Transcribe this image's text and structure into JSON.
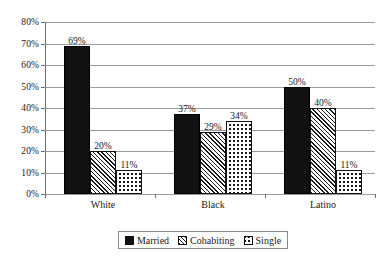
{
  "chart_data": {
    "type": "bar",
    "title": "",
    "subtitle": "",
    "xlabel": "",
    "ylabel": "",
    "categories": [
      "White",
      "Black",
      "Latino"
    ],
    "series": [
      {
        "name": "Married",
        "values": [
          69,
          20,
          11
        ]
      },
      {
        "name": "Cohabiting",
        "values": [
          37,
          29,
          34
        ]
      },
      {
        "name": "Single",
        "values": [
          50,
          40,
          11
        ]
      }
    ],
    "series_by_category": [
      {
        "category": "White",
        "Married": 69,
        "Cohabiting": 20,
        "Single": 11
      },
      {
        "category": "Black",
        "Married": 37,
        "Cohabiting": 29,
        "Single": 34
      },
      {
        "category": "Latino",
        "Married": 50,
        "Cohabiting": 40,
        "Single": 11
      }
    ],
    "data_labels": [
      "69%",
      "20%",
      "11%",
      "37%",
      "29%",
      "34%",
      "50%",
      "40%",
      "11%"
    ],
    "ylim": [
      0,
      80
    ],
    "ytick_values": [
      0,
      10,
      20,
      30,
      40,
      50,
      60,
      70,
      80
    ],
    "ytick_labels": [
      "0%",
      "10%",
      "20%",
      "30%",
      "40%",
      "50%",
      "60%",
      "70%",
      "80%"
    ],
    "grid": "horizontal",
    "legend_position": "bottom-center",
    "colors": {
      "married": "#111111",
      "cohabiting_pattern": "diagonal-hatch",
      "single_pattern": "dotted",
      "gridline": "#9a9a9a",
      "axis": "#6e6e6e",
      "background": "#ffffff",
      "text": "#1a1a1a"
    }
  },
  "legend": {
    "items": [
      {
        "label": "Married",
        "swatch": "solid-black-swatch"
      },
      {
        "label": "Cohabiting",
        "swatch": "diagonal-hatch-swatch"
      },
      {
        "label": "Single",
        "swatch": "dotted-swatch"
      }
    ]
  }
}
